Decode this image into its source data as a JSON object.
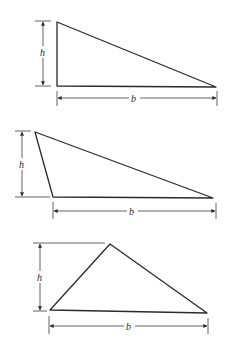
{
  "figure": {
    "triangles": [
      {
        "id": "right-triangle",
        "kind": "right",
        "height_label": "h",
        "base_label": "b"
      },
      {
        "id": "obtuse-triangle",
        "kind": "obtuse",
        "height_label": "h",
        "base_label": "b"
      },
      {
        "id": "acute-triangle",
        "kind": "acute",
        "height_label": "h",
        "base_label": "b"
      }
    ]
  },
  "colors": {
    "stroke": "#2a2a2a",
    "background": "#ffffff"
  }
}
